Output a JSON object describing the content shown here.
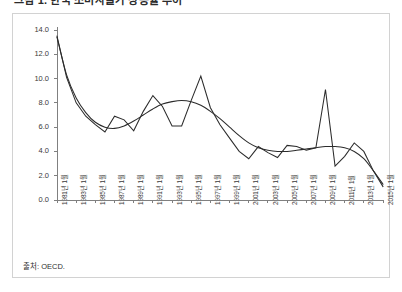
{
  "title": "그림 1. 한국 소비자물가 상승률 추이",
  "source_note": "출처: OECD.",
  "axis": {
    "y_ticks": [
      "14.0",
      "12.0",
      "10.0",
      "8.0",
      "6.0",
      "4.0",
      "2.0",
      "0.0"
    ],
    "x_ticks": [
      "1981년 1월",
      "1983년 1월",
      "1985년 1월",
      "1987년 1월",
      "1989년 1월",
      "1991년 1월",
      "1993년 1월",
      "1995년 1월",
      "1997년 1월",
      "1999년 1월",
      "2001년 1월",
      "2003년 1월",
      "2005년 1월",
      "2007년 1월",
      "2009년 1월",
      "2011년 1월",
      "2013년 1월",
      "2015년 1월"
    ]
  },
  "chart_data": {
    "type": "line",
    "title": "그림 1. 한국 소비자물가 상승률 추이",
    "xlabel": "",
    "ylabel": "",
    "ylim": [
      0.0,
      14.0
    ],
    "ytick_step": 2.0,
    "grid": false,
    "legend": "none",
    "x": [
      "1981",
      "1982",
      "1983",
      "1984",
      "1985",
      "1986",
      "1987",
      "1988",
      "1989",
      "1990",
      "1991",
      "1992",
      "1993",
      "1994",
      "1995",
      "1996",
      "1997",
      "1998",
      "1999",
      "2000",
      "2001",
      "2002",
      "2003",
      "2004",
      "2005",
      "2006",
      "2007",
      "2008",
      "2009",
      "2010",
      "2011",
      "2012",
      "2013",
      "2014",
      "2015"
    ],
    "series": [
      {
        "name": "실측치",
        "style": "jagged",
        "values": [
          13.5,
          10.1,
          8.0,
          6.9,
          6.2,
          5.6,
          6.9,
          6.6,
          5.7,
          7.3,
          8.6,
          7.7,
          6.1,
          6.1,
          8.2,
          10.2,
          7.6,
          6.2,
          5.1,
          4.0,
          3.4,
          4.4,
          3.9,
          3.5,
          4.5,
          4.4,
          4.1,
          4.3,
          9.1,
          2.8,
          3.6,
          4.7,
          4.0,
          2.4,
          1.1
        ]
      },
      {
        "name": "추세선",
        "style": "smooth",
        "values": [
          13.4,
          10.3,
          8.4,
          7.2,
          6.4,
          6.0,
          5.9,
          6.1,
          6.5,
          7.0,
          7.5,
          7.9,
          8.1,
          8.2,
          8.1,
          7.8,
          7.3,
          6.7,
          6.0,
          5.3,
          4.7,
          4.3,
          4.1,
          4.0,
          4.0,
          4.1,
          4.2,
          4.3,
          4.4,
          4.4,
          4.3,
          4.0,
          3.4,
          2.4,
          1.3
        ]
      }
    ]
  },
  "colors": {
    "line": "#2b2b2b",
    "axis": "#808080",
    "panel_border": "#d2d2d2",
    "background": "#ffffff"
  }
}
